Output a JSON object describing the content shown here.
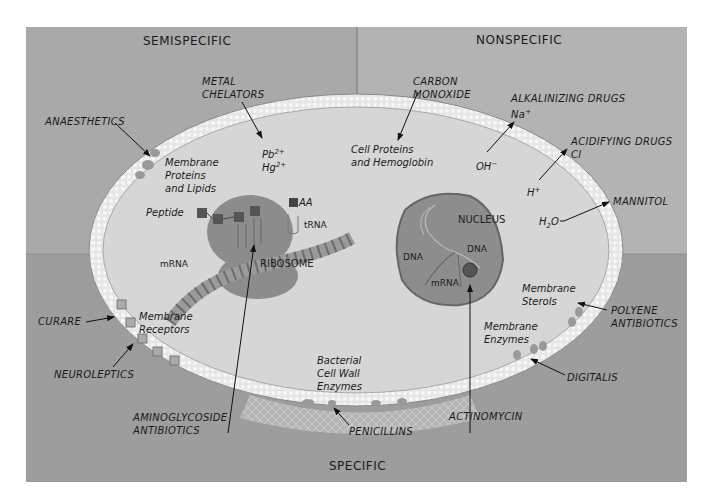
{
  "zones": {
    "top_left": "SEMISPECIFIC",
    "top_right": "NONSPECIFIC",
    "bottom": "SPECIFIC"
  },
  "drug_labels": {
    "anaesthetics": "ANAESTHETICS",
    "metal_chelators_1": "METAL",
    "metal_chelators_2": "CHELATORS",
    "carbon_monoxide_1": "CARBON",
    "carbon_monoxide_2": "MONOXIDE",
    "alkalinizing_drugs": "ALKALINIZING DRUGS",
    "alkalinizing_ion": "Na",
    "alkalinizing_ion_charge": "+",
    "acidifying_drugs": "ACIDIFYING DRUGS",
    "acidifying_ion": "Cl",
    "mannitol": "MANNITOL",
    "curare": "CURARE",
    "neuroleptics": "NEUROLEPTICS",
    "polyene_antibiotics_1": "POLYENE",
    "polyene_antibiotics_2": "ANTIBIOTICS",
    "digitalis": "DIGITALIS",
    "aminoglycoside_1": "AMINOGLYCOSIDE",
    "aminoglycoside_2": "ANTIBIOTICS",
    "penicillins": "PENICILLINS",
    "actinomycin": "ACTINOMYCIN"
  },
  "targets": {
    "membrane_proteins_lipids_1": "Membrane",
    "membrane_proteins_lipids_2": "Proteins",
    "membrane_proteins_lipids_3": "and Lipids",
    "pb": "Pb",
    "pb_charge": "2+",
    "hg": "Hg",
    "hg_charge": "2+",
    "cell_proteins_1": "Cell Proteins",
    "cell_proteins_2": "and Hemoglobin",
    "oh": "OH",
    "oh_charge": "−",
    "h": "H",
    "h_charge": "+",
    "h2o_h": "H",
    "h2o_sub": "2",
    "h2o_o": "O",
    "membrane_receptors_1": "Membrane",
    "membrane_receptors_2": "Receptors",
    "membrane_sterols_1": "Membrane",
    "membrane_sterols_2": "Sterols",
    "membrane_enzymes_1": "Membrane",
    "membrane_enzymes_2": "Enzymes",
    "cell_wall_1": "Bacterial",
    "cell_wall_2": "Cell Wall",
    "cell_wall_3": "Enzymes"
  },
  "structures": {
    "peptide": "Peptide",
    "aa": "AA",
    "trna": "tRNA",
    "mrna_left": "mRNA",
    "ribosome": "RIBOSOME",
    "nucleus": "NUCLEUS",
    "dna_left": "DNA",
    "dna_right": "DNA",
    "mrna_nucleus": "mRNA"
  },
  "colors": {
    "top_panel": "#a9a9a9",
    "bottom_panel": "#9a9a9a",
    "cell_interior": "#d6d6d6",
    "membrane": "#ececec",
    "organelle": "#8c8c8c"
  }
}
